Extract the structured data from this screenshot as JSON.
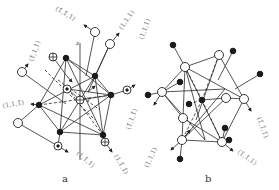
{
  "figure": {
    "panels": [
      {
        "caption": "a",
        "axis_labels": [
          "z",
          "y"
        ],
        "direction_labels": [
          "(1̄,1̄,1)",
          "(1,1,1)",
          "(1̄,1,1)",
          "(1,1,1̄)",
          "(1̄,1,1̄)",
          "(1,1̄,1)",
          "(1,1̄,1̄)"
        ],
        "legend_symbols": [
          "open-circle",
          "filled-circle",
          "circled-dot",
          "circled-plus"
        ]
      },
      {
        "caption": "b",
        "direction_labels": [
          "(1,1,1)",
          "(1̄,1̄,1̄)",
          "(1,1,1)",
          "(1̄,1̄,1)"
        ],
        "legend_symbols": [
          "open-circle",
          "filled-circle"
        ]
      }
    ]
  }
}
